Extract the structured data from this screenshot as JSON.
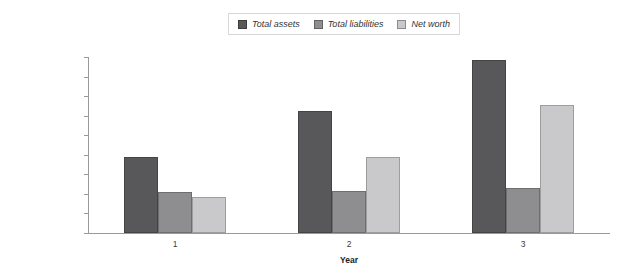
{
  "chart_data": {
    "type": "bar",
    "title": "",
    "xlabel": "Year",
    "ylabel": "",
    "categories": [
      "1",
      "2",
      "3"
    ],
    "series": [
      {
        "name": "Total assets",
        "color": "#58585a",
        "values": [
          195000,
          313000,
          443000
        ]
      },
      {
        "name": "Total liabilities",
        "color": "#8e8e90",
        "values": [
          105000,
          108000,
          115000
        ]
      },
      {
        "name": "Net worth",
        "color": "#c9c9cb",
        "values": [
          93000,
          195000,
          328000
        ]
      }
    ],
    "ylim": [
      0,
      450000
    ],
    "ytick_step": 50000,
    "ytick_labels": [
      "$0",
      "$50,000",
      "$100,000",
      "$150,000",
      "$200,000",
      "$250,000",
      "$300,000",
      "$350,000",
      "$400,000",
      "$450,000"
    ],
    "grid": false,
    "legend_position": "top-center"
  }
}
